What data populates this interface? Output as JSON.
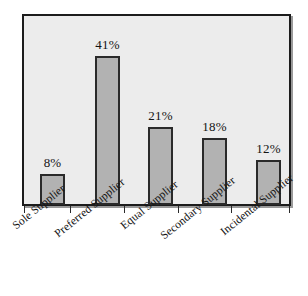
{
  "chart_data": {
    "type": "bar",
    "title": "",
    "subtitle": "",
    "xlabel": "",
    "ylabel": "",
    "categories": [
      "Sole Supplier",
      "Preferred Supplier",
      "Equal Supplier",
      "Secondary Supplier",
      "Incidental Supplier"
    ],
    "values": [
      8,
      41,
      21,
      18,
      12
    ],
    "value_labels": [
      "8%",
      "41%",
      "21%",
      "18%",
      "12%"
    ],
    "ylim": [
      0,
      47
    ],
    "grid": false,
    "legend": "none",
    "axis_tick_labels": [],
    "annotations": []
  },
  "style": {
    "bar_fill": "#b2b2b2",
    "bar_border": "#2a2a2a",
    "plot_background": "#ececec",
    "plot_border": "#1c1c1c",
    "page_background": "#ffffff",
    "label_color": "#141414"
  }
}
